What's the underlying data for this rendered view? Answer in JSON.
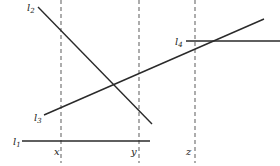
{
  "diagram": {
    "width": 280,
    "height": 166,
    "colors": {
      "line": "#2a2a2a",
      "dashed": "#6a6a6a",
      "text": "#222222",
      "background": "#ffffff"
    },
    "vertical_dashed_lines": [
      {
        "id": "x",
        "label": "x",
        "x": 61,
        "y1": 0,
        "y2": 163,
        "label_x": 54,
        "label_y": 155
      },
      {
        "id": "y",
        "label": "y",
        "x": 139,
        "y1": 0,
        "y2": 163,
        "label_x": 131,
        "label_y": 155
      },
      {
        "id": "z",
        "label": "z",
        "x": 195,
        "y1": 0,
        "y2": 163,
        "label_x": 186,
        "label_y": 155
      }
    ],
    "lines": [
      {
        "id": "l1",
        "label": "l",
        "subscript": "1",
        "x1": 22,
        "y1": 141,
        "x2": 150,
        "y2": 141,
        "label_x": 13,
        "label_y": 145
      },
      {
        "id": "l2",
        "label": "l",
        "subscript": "2",
        "x1": 38,
        "y1": 7,
        "x2": 152,
        "y2": 124,
        "label_x": 27,
        "label_y": 11
      },
      {
        "id": "l3",
        "label": "l",
        "subscript": "3",
        "x1": 44,
        "y1": 115,
        "x2": 264,
        "y2": 19,
        "label_x": 34,
        "label_y": 121
      },
      {
        "id": "l4",
        "label": "l",
        "subscript": "4",
        "x1": 186,
        "y1": 41,
        "x2": 280,
        "y2": 41,
        "label_x": 175,
        "label_y": 45
      }
    ]
  }
}
